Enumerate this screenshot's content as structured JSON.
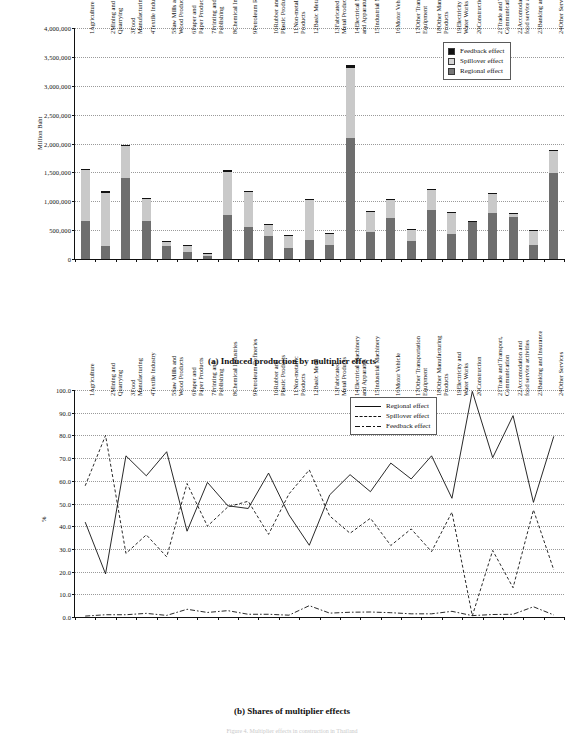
{
  "figure": {
    "panel_a_caption": "(a) Induced production by multiplier effects",
    "panel_b_caption": "(b) Shares of multiplier effects",
    "footnote": "Figure 4. Multiplier effects in construction in Thailand"
  },
  "categories": [
    "1Agriculture",
    "2Mining and\nQuarrying",
    "3Food\nManufacturing",
    "4Textile Industry",
    "5Saw Mills and\nWood Products",
    "6Paper and\nPaper Products",
    "7Printing and\nPublishing",
    "8Chemical Industries",
    "9Petroleum Refineries",
    "10Rubber and\nPlastic Products",
    "11Non-metallic\nProducts",
    "12Basic Metal",
    "13Fabricated\nMetal Products",
    "14Electrical Machinery\nand Apparatus",
    "15Industrial Machinery",
    "16Motor Vehicle",
    "17Other Transportation\nEquipment",
    "18Other Manufacturing\nProducts",
    "19Electricity and\nWater Works",
    "20Construction",
    "21Trade and Transport,\nCommunication",
    "22Accomodation and\nfood service activities",
    "23Banking and Insurance",
    "24Other Services"
  ],
  "colors": {
    "regional": "#6e6e6e",
    "spillover": "#c9c9c9",
    "feedback": "#121212",
    "axis": "#111111",
    "grid": "#9a9a9a"
  },
  "chart_data": [
    {
      "id": "panel-a",
      "type": "bar",
      "stacked": true,
      "title": "(a) Induced production by multiplier effects",
      "xlabel": "",
      "ylabel": "Million Baht",
      "ylim": [
        0,
        4000000
      ],
      "ytick_values": [
        0,
        500000,
        1000000,
        1500000,
        2000000,
        2500000,
        3000000,
        3500000,
        4000000
      ],
      "ytick_labels": [
        "0",
        "500,000",
        "1,000,000",
        "1,500,000",
        "2,000,000",
        "2,500,000",
        "3,000,000",
        "3,500,000",
        "4,000,000"
      ],
      "grid": true,
      "legend_position": "top-right",
      "categories": [
        "1Agriculture",
        "2Mining and Quarrying",
        "3Food Manufacturing",
        "4Textile Industry",
        "5Saw Mills and Wood Products",
        "6Paper and Paper Products",
        "7Printing and Publishing",
        "8Chemical Industries",
        "9Petroleum Refineries",
        "10Rubber and Plastic Products",
        "11Non-metallic Products",
        "12Basic Metal",
        "13Fabricated Metal Products",
        "14Electrical Machinery and Apparatus",
        "15Industrial Machinery",
        "16Motor Vehicle",
        "17Other Transportation Equipment",
        "18Other Manufacturing Products",
        "19Electricity and Water Works",
        "20Construction",
        "21Trade and Transport, Communication",
        "22Accomodation and food service activities",
        "23Banking and Insurance",
        "24Other Services"
      ],
      "series": [
        {
          "name": "Regional effect",
          "color": "#6e6e6e",
          "values": [
            655000,
            225000,
            1400000,
            660000,
            220000,
            120000,
            60000,
            755000,
            560000,
            390000,
            195000,
            335000,
            250000,
            2100000,
            460000,
            705000,
            315000,
            850000,
            425000,
            660000,
            800000,
            725000,
            240000,
            1485000
          ]
        },
        {
          "name": "Spillover effect",
          "color": "#c9c9c9",
          "values": [
            900000,
            925000,
            560000,
            395000,
            80000,
            110000,
            45000,
            760000,
            610000,
            215000,
            210000,
            690000,
            190000,
            1215000,
            360000,
            330000,
            195000,
            340000,
            375000,
            0,
            330000,
            65000,
            255000,
            390000
          ]
        },
        {
          "name": "Feedback effect",
          "color": "#121212",
          "values": [
            10000,
            22000,
            12000,
            10000,
            5000,
            5000,
            2000,
            20000,
            8000,
            8000,
            5000,
            22000,
            8000,
            50000,
            10000,
            12000,
            8000,
            20000,
            10000,
            2000,
            12000,
            8000,
            10000,
            12000
          ]
        }
      ],
      "legend": [
        {
          "label": "Feedback effect",
          "color": "#121212"
        },
        {
          "label": "Spillover effect",
          "color": "#d5d5d5"
        },
        {
          "label": "Regional effect",
          "color": "#767676"
        }
      ]
    },
    {
      "id": "panel-b",
      "type": "line",
      "title": "(b) Shares of multiplier effects",
      "xlabel": "",
      "ylabel": "%",
      "ylim": [
        0,
        100
      ],
      "ytick_values": [
        0,
        10,
        20,
        30,
        40,
        50,
        60,
        70,
        80,
        90,
        100
      ],
      "ytick_labels": [
        "0.0",
        "10.0",
        "20.0",
        "30.0",
        "40.0",
        "50.0",
        "60.0",
        "70.0",
        "80.0",
        "90.0",
        "100.0"
      ],
      "grid": true,
      "legend_position": "top-right",
      "categories": [
        "1Agriculture",
        "2Mining and Quarrying",
        "3Food Manufacturing",
        "4Textile Industry",
        "5Saw Mills and Wood Products",
        "6Paper and Paper Products",
        "7Printing and Publishing",
        "8Chemical Industries",
        "9Petroleum Refineries",
        "10Rubber and Plastic Products",
        "11Non-metallic Products",
        "12Basic Metal",
        "13Fabricated Metal Products",
        "14Electrical Machinery and Apparatus",
        "15Industrial Machinery",
        "16Motor Vehicle",
        "17Other Transportation Equipment",
        "18Other Manufacturing Products",
        "19Electricity and Water Works",
        "20Construction",
        "21Trade and Transport, Communication",
        "22Accomodation and food service activities",
        "23Banking and Insurance",
        "24Other Services"
      ],
      "series": [
        {
          "name": "Regional effect",
          "style": "solid",
          "values": [
            41.8,
            19.0,
            71.0,
            62.2,
            72.8,
            37.8,
            59.3,
            49.0,
            47.8,
            63.4,
            45.0,
            31.6,
            53.8,
            62.7,
            55.2,
            67.8,
            60.8,
            71.0,
            52.3,
            99.4,
            70.2,
            88.7,
            50.5,
            79.6
          ]
        },
        {
          "name": "Spillover effect",
          "style": "dashed",
          "values": [
            57.8,
            80.0,
            28.0,
            36.2,
            26.5,
            58.8,
            40.0,
            48.5,
            51.0,
            36.4,
            54.2,
            64.8,
            44.5,
            36.9,
            43.5,
            31.5,
            38.8,
            28.8,
            46.2,
            0.5,
            29.3,
            12.9,
            47.2,
            20.7
          ]
        },
        {
          "name": "Feedback effect",
          "style": "dashdot",
          "values": [
            0.4,
            1.0,
            1.0,
            1.6,
            0.7,
            3.4,
            2.0,
            2.8,
            1.2,
            1.2,
            0.8,
            5.0,
            1.7,
            2.1,
            2.2,
            1.9,
            1.4,
            1.4,
            2.5,
            0.6,
            1.1,
            1.2,
            4.5,
            0.9
          ]
        }
      ],
      "legend": [
        {
          "label": "Regional effect",
          "style": "solid"
        },
        {
          "label": "Spillover effect",
          "style": "dashed"
        },
        {
          "label": "Feedback effect",
          "style": "dashdot"
        }
      ]
    }
  ]
}
